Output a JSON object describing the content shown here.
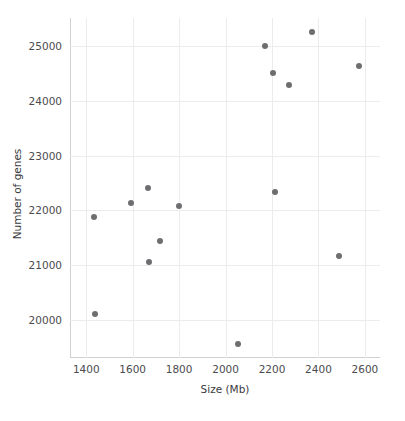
{
  "chart_data": {
    "type": "scatter",
    "title": "",
    "xlabel": "Size (Mb)",
    "ylabel": "Number of genes",
    "xlim": [
      1330,
      2665
    ],
    "ylim": [
      19300,
      25520
    ],
    "xticks": [
      1400,
      1600,
      1800,
      2000,
      2200,
      2400,
      2600
    ],
    "xtick_labels": [
      "1400",
      "1600",
      "1800",
      "2000",
      "2200",
      "2400",
      "2600"
    ],
    "yticks": [
      20000,
      21000,
      22000,
      23000,
      24000,
      25000
    ],
    "ytick_labels": [
      "20000",
      "21000",
      "22000",
      "23000",
      "24000",
      "25000"
    ],
    "grid": true,
    "legend": null,
    "marker_color": "#6e6e71",
    "grid_color": "#ececed",
    "axis_color": "#cfcfd4",
    "background_color": "#ffffff",
    "points": [
      {
        "x": 1437,
        "y": 20100
      },
      {
        "x": 1432,
        "y": 21880
      },
      {
        "x": 1592,
        "y": 22140
      },
      {
        "x": 1668,
        "y": 22415
      },
      {
        "x": 1672,
        "y": 21065
      },
      {
        "x": 1718,
        "y": 21440
      },
      {
        "x": 1800,
        "y": 22075
      },
      {
        "x": 2053,
        "y": 19550
      },
      {
        "x": 2168,
        "y": 25000
      },
      {
        "x": 2205,
        "y": 24520
      },
      {
        "x": 2212,
        "y": 22330
      },
      {
        "x": 2272,
        "y": 24300
      },
      {
        "x": 2372,
        "y": 25265
      },
      {
        "x": 2490,
        "y": 21165
      },
      {
        "x": 2573,
        "y": 24640
      }
    ]
  }
}
